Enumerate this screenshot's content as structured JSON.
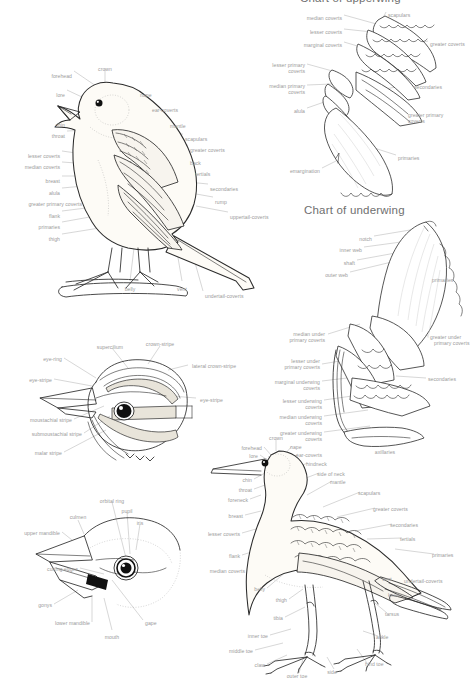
{
  "page": {
    "background": "#ffffff",
    "ink_color": "#2b2b2b",
    "label_color": "#9a9a9a",
    "title_color": "#6f6f6f",
    "width": 472,
    "height": 682
  },
  "titles": {
    "upperwing": "Chart of upperwing",
    "underwing": "Chart of underwing"
  },
  "passerine": {
    "name": "perched-passerine-topography",
    "labels": [
      {
        "text": "forehead",
        "x": 72,
        "y": 73,
        "align": "r"
      },
      {
        "text": "crown",
        "x": 105,
        "y": 66,
        "align": "c"
      },
      {
        "text": "lore",
        "x": 65,
        "y": 92,
        "align": "r"
      },
      {
        "text": "nape",
        "x": 140,
        "y": 92,
        "align": "l"
      },
      {
        "text": "ear-coverts",
        "x": 152,
        "y": 107,
        "align": "l"
      },
      {
        "text": "chin",
        "x": 65,
        "y": 122,
        "align": "r"
      },
      {
        "text": "mantle",
        "x": 170,
        "y": 123,
        "align": "l"
      },
      {
        "text": "throat",
        "x": 65,
        "y": 133,
        "align": "r"
      },
      {
        "text": "scapulars",
        "x": 185,
        "y": 136,
        "align": "l"
      },
      {
        "text": "greater coverts",
        "x": 190,
        "y": 147,
        "align": "l"
      },
      {
        "text": "lesser coverts",
        "x": 60,
        "y": 153,
        "align": "r"
      },
      {
        "text": "back",
        "x": 190,
        "y": 160,
        "align": "l"
      },
      {
        "text": "median coverts",
        "x": 60,
        "y": 164,
        "align": "r"
      },
      {
        "text": "tertials",
        "x": 195,
        "y": 171,
        "align": "l"
      },
      {
        "text": "breast",
        "x": 60,
        "y": 178,
        "align": "r"
      },
      {
        "text": "alula",
        "x": 60,
        "y": 190,
        "align": "r"
      },
      {
        "text": "secondaries",
        "x": 210,
        "y": 186,
        "align": "l"
      },
      {
        "text": "greater primary coverts",
        "x": 82,
        "y": 201,
        "align": "r"
      },
      {
        "text": "rump",
        "x": 215,
        "y": 199,
        "align": "l"
      },
      {
        "text": "flank",
        "x": 60,
        "y": 213,
        "align": "r"
      },
      {
        "text": "uppertail-coverts",
        "x": 230,
        "y": 214,
        "align": "l"
      },
      {
        "text": "primaries",
        "x": 60,
        "y": 224,
        "align": "r"
      },
      {
        "text": "thigh",
        "x": 60,
        "y": 236,
        "align": "r"
      },
      {
        "text": "belly",
        "x": 130,
        "y": 286,
        "align": "c"
      },
      {
        "text": "vent",
        "x": 182,
        "y": 286,
        "align": "c"
      },
      {
        "text": "undertail-coverts",
        "x": 205,
        "y": 293,
        "align": "l"
      }
    ]
  },
  "upperwing": {
    "name": "upperwing-topography",
    "labels": [
      {
        "text": "median coverts",
        "x": 342,
        "y": 15,
        "align": "r"
      },
      {
        "text": "scapulars",
        "x": 388,
        "y": 12,
        "align": "l"
      },
      {
        "text": "lesser coverts",
        "x": 342,
        "y": 29,
        "align": "r"
      },
      {
        "text": "marginal coverts",
        "x": 342,
        "y": 42,
        "align": "r"
      },
      {
        "text": "greater coverts",
        "x": 430,
        "y": 41,
        "align": "l"
      },
      {
        "text": "lesser primary",
        "x": 305,
        "y": 62,
        "align": "r"
      },
      {
        "text": "coverts",
        "x": 305,
        "y": 68,
        "align": "r"
      },
      {
        "text": "median primary",
        "x": 305,
        "y": 83,
        "align": "r"
      },
      {
        "text": "coverts",
        "x": 305,
        "y": 89,
        "align": "r"
      },
      {
        "text": "secondaries",
        "x": 414,
        "y": 84,
        "align": "l"
      },
      {
        "text": "alula",
        "x": 305,
        "y": 108,
        "align": "r"
      },
      {
        "text": "greater primary",
        "x": 408,
        "y": 112,
        "align": "l"
      },
      {
        "text": "coverts",
        "x": 408,
        "y": 118,
        "align": "l"
      },
      {
        "text": "primaries",
        "x": 398,
        "y": 155,
        "align": "l"
      },
      {
        "text": "emargination",
        "x": 320,
        "y": 168,
        "align": "r"
      }
    ]
  },
  "underwing": {
    "name": "underwing-topography",
    "labels": [
      {
        "text": "notch",
        "x": 372,
        "y": 236,
        "align": "r"
      },
      {
        "text": "inner web",
        "x": 362,
        "y": 247,
        "align": "r"
      },
      {
        "text": "shaft",
        "x": 355,
        "y": 260,
        "align": "r"
      },
      {
        "text": "outer web",
        "x": 348,
        "y": 272,
        "align": "r"
      },
      {
        "text": "primaries",
        "x": 432,
        "y": 277,
        "align": "l"
      },
      {
        "text": "median under",
        "x": 325,
        "y": 331,
        "align": "r"
      },
      {
        "text": "primary coverts",
        "x": 325,
        "y": 337,
        "align": "r"
      },
      {
        "text": "lesser under",
        "x": 320,
        "y": 358,
        "align": "r"
      },
      {
        "text": "primary coverts",
        "x": 320,
        "y": 364,
        "align": "r"
      },
      {
        "text": "greater under",
        "x": 430,
        "y": 334,
        "align": "l"
      },
      {
        "text": "primary coverts",
        "x": 434,
        "y": 340,
        "align": "l"
      },
      {
        "text": "marginal underwing",
        "x": 320,
        "y": 379,
        "align": "r"
      },
      {
        "text": "coverts",
        "x": 320,
        "y": 385,
        "align": "r"
      },
      {
        "text": "lesser underwing",
        "x": 322,
        "y": 398,
        "align": "r"
      },
      {
        "text": "coverts",
        "x": 322,
        "y": 404,
        "align": "r"
      },
      {
        "text": "secondaries",
        "x": 428,
        "y": 376,
        "align": "l"
      },
      {
        "text": "median underwing",
        "x": 322,
        "y": 414,
        "align": "r"
      },
      {
        "text": "coverts",
        "x": 322,
        "y": 420,
        "align": "r"
      },
      {
        "text": "greater underwing",
        "x": 322,
        "y": 430,
        "align": "r"
      },
      {
        "text": "coverts",
        "x": 322,
        "y": 436,
        "align": "r"
      },
      {
        "text": "axillaries",
        "x": 385,
        "y": 449,
        "align": "c"
      }
    ]
  },
  "head": {
    "name": "head-stripes-topography",
    "labels": [
      {
        "text": "supercilium",
        "x": 110,
        "y": 344,
        "align": "c"
      },
      {
        "text": "crown-stripe",
        "x": 160,
        "y": 341,
        "align": "c"
      },
      {
        "text": "eye-ring",
        "x": 62,
        "y": 356,
        "align": "r"
      },
      {
        "text": "lateral crown-stripe",
        "x": 192,
        "y": 363,
        "align": "l"
      },
      {
        "text": "eye-stripe",
        "x": 52,
        "y": 377,
        "align": "r"
      },
      {
        "text": "eye-stripe",
        "x": 200,
        "y": 397,
        "align": "l"
      },
      {
        "text": "moustachial stripe",
        "x": 72,
        "y": 417,
        "align": "r"
      },
      {
        "text": "submoustachial stripe",
        "x": 82,
        "y": 431,
        "align": "r"
      },
      {
        "text": "malar stripe",
        "x": 62,
        "y": 450,
        "align": "r"
      }
    ]
  },
  "bill": {
    "name": "bill-and-eye-topography",
    "labels": [
      {
        "text": "orbital ring",
        "x": 112,
        "y": 498,
        "align": "c"
      },
      {
        "text": "pupil",
        "x": 127,
        "y": 508,
        "align": "c"
      },
      {
        "text": "iris",
        "x": 140,
        "y": 520,
        "align": "c"
      },
      {
        "text": "culmen",
        "x": 78,
        "y": 514,
        "align": "c"
      },
      {
        "text": "upper mandible",
        "x": 60,
        "y": 530,
        "align": "r"
      },
      {
        "text": "cutting edges",
        "x": 78,
        "y": 566,
        "align": "r"
      },
      {
        "text": "gonys",
        "x": 52,
        "y": 602,
        "align": "r"
      },
      {
        "text": "lower mandible",
        "x": 90,
        "y": 620,
        "align": "r"
      },
      {
        "text": "mouth",
        "x": 112,
        "y": 634,
        "align": "c"
      },
      {
        "text": "gape",
        "x": 145,
        "y": 620,
        "align": "l"
      }
    ]
  },
  "wader": {
    "name": "wader-topography",
    "labels": [
      {
        "text": "crown",
        "x": 276,
        "y": 435,
        "align": "c"
      },
      {
        "text": "forehead",
        "x": 262,
        "y": 445,
        "align": "r"
      },
      {
        "text": "nape",
        "x": 290,
        "y": 444,
        "align": "l"
      },
      {
        "text": "lore",
        "x": 258,
        "y": 453,
        "align": "r"
      },
      {
        "text": "ear-coverts",
        "x": 296,
        "y": 452,
        "align": "l"
      },
      {
        "text": "hindneck",
        "x": 306,
        "y": 461,
        "align": "l"
      },
      {
        "text": "side of neck",
        "x": 317,
        "y": 471,
        "align": "l"
      },
      {
        "text": "chin",
        "x": 252,
        "y": 477,
        "align": "r"
      },
      {
        "text": "mantle",
        "x": 330,
        "y": 479,
        "align": "l"
      },
      {
        "text": "throat",
        "x": 252,
        "y": 487,
        "align": "r"
      },
      {
        "text": "foreneck",
        "x": 248,
        "y": 497,
        "align": "r"
      },
      {
        "text": "scapulars",
        "x": 358,
        "y": 490,
        "align": "l"
      },
      {
        "text": "breast",
        "x": 243,
        "y": 513,
        "align": "r"
      },
      {
        "text": "greater coverts",
        "x": 373,
        "y": 506,
        "align": "l"
      },
      {
        "text": "lesser coverts",
        "x": 240,
        "y": 531,
        "align": "r"
      },
      {
        "text": "secondaries",
        "x": 390,
        "y": 522,
        "align": "l"
      },
      {
        "text": "tertials",
        "x": 400,
        "y": 536,
        "align": "l"
      },
      {
        "text": "flank",
        "x": 240,
        "y": 553,
        "align": "r"
      },
      {
        "text": "primaries",
        "x": 432,
        "y": 552,
        "align": "l"
      },
      {
        "text": "median coverts",
        "x": 245,
        "y": 568,
        "align": "r"
      },
      {
        "text": "vent",
        "x": 382,
        "y": 576,
        "align": "l"
      },
      {
        "text": "undertail-coverts",
        "x": 404,
        "y": 578,
        "align": "l"
      },
      {
        "text": "belly",
        "x": 265,
        "y": 586,
        "align": "r"
      },
      {
        "text": "knee",
        "x": 388,
        "y": 592,
        "align": "l"
      },
      {
        "text": "thigh",
        "x": 287,
        "y": 597,
        "align": "r"
      },
      {
        "text": "tibia",
        "x": 283,
        "y": 615,
        "align": "r"
      },
      {
        "text": "tarsus",
        "x": 385,
        "y": 611,
        "align": "l"
      },
      {
        "text": "inner toe",
        "x": 268,
        "y": 633,
        "align": "r"
      },
      {
        "text": "ankle",
        "x": 376,
        "y": 634,
        "align": "l"
      },
      {
        "text": "middle toe",
        "x": 253,
        "y": 648,
        "align": "r"
      },
      {
        "text": "claw",
        "x": 265,
        "y": 662,
        "align": "r"
      },
      {
        "text": "hind toe",
        "x": 365,
        "y": 661,
        "align": "l"
      },
      {
        "text": "outer toe",
        "x": 297,
        "y": 673,
        "align": "c"
      },
      {
        "text": "side",
        "x": 332,
        "y": 669,
        "align": "c"
      }
    ]
  }
}
